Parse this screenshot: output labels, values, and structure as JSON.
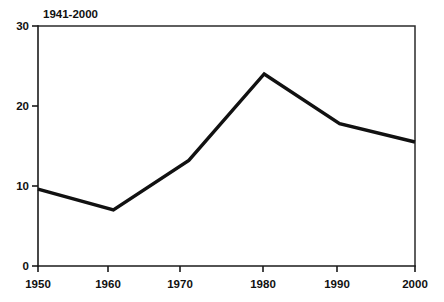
{
  "chart_data": {
    "type": "line",
    "title": "1941-2000",
    "xlabel": "",
    "ylabel": "",
    "x": [
      1950,
      1960,
      1970,
      1980,
      1990,
      2000
    ],
    "values": [
      9.6,
      7.0,
      13.2,
      24.0,
      17.8,
      15.5
    ],
    "series": [
      {
        "name": "1941-2000",
        "values": [
          9.6,
          7.0,
          13.2,
          24.0,
          17.8,
          15.5
        ]
      }
    ],
    "xlim": [
      1950,
      2000
    ],
    "ylim": [
      0,
      30
    ],
    "x_ticks": [
      "1950",
      "1960",
      "1970",
      "1980",
      "1990",
      "2000"
    ],
    "y_ticks": [
      "0",
      "10",
      "20",
      "30"
    ],
    "y_tick_values": [
      0,
      10,
      20,
      30
    ],
    "grid": false,
    "legend": false,
    "line_color": "#111111"
  },
  "labels": {
    "title": "1941-2000",
    "y0": "0",
    "y10": "10",
    "y20": "20",
    "y30": "30",
    "x1950": "1950",
    "x1960": "1960",
    "x1970": "1970",
    "x1980": "1980",
    "x1990": "1990",
    "x2000": "2000"
  }
}
